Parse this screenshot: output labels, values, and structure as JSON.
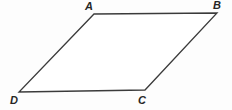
{
  "figure": {
    "name": "parallelogram-abcd",
    "background_color": "#fdfdfd",
    "stroke_color": "#3b3b3b",
    "fill_color": "#ffffff",
    "stroke_width": 1.3,
    "canvas": {
      "width": 232,
      "height": 110
    },
    "vertices": [
      {
        "id": "A",
        "label": "A",
        "x": 94,
        "y": 14
      },
      {
        "id": "B",
        "label": "B",
        "x": 217,
        "y": 13
      },
      {
        "id": "C",
        "label": "C",
        "x": 145,
        "y": 90
      },
      {
        "id": "D",
        "label": "D",
        "x": 19,
        "y": 92
      }
    ],
    "edges": [
      {
        "id": "AB",
        "from": "A",
        "to": "B"
      },
      {
        "id": "BC",
        "from": "B",
        "to": "C"
      },
      {
        "id": "CD",
        "from": "C",
        "to": "D"
      },
      {
        "id": "DA",
        "from": "D",
        "to": "A"
      }
    ],
    "polygon_points": "94,14 217,13 145,90 19,92",
    "labels": {
      "A": "A",
      "B": "B",
      "C": "C",
      "D": "D"
    }
  }
}
